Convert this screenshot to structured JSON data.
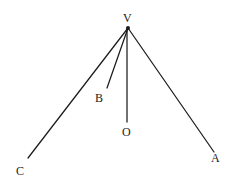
{
  "figure": {
    "name": "angle-rays-from-vertex-diagram",
    "background_color": "#ffffff",
    "stroke_color": "#1c1c1c",
    "label_color": "#1c1c1c",
    "width": 239,
    "height": 187,
    "vertex": {
      "label": "V",
      "x": 128,
      "y": 28
    },
    "points": [
      {
        "id": "V",
        "label": "V",
        "x": 128,
        "y": 28,
        "label_x": 125,
        "label_y": 18
      },
      {
        "id": "B",
        "label": "B",
        "x": 107,
        "y": 88,
        "label_x": 99,
        "label_y": 98
      },
      {
        "id": "O",
        "label": "O",
        "x": 127,
        "y": 122,
        "label_x": 127,
        "label_y": 132
      },
      {
        "id": "C",
        "label": "C",
        "x": 28,
        "y": 158,
        "label_x": 21,
        "label_y": 171
      },
      {
        "id": "A",
        "label": "A",
        "x": 214,
        "y": 152,
        "label_x": 216,
        "label_y": 158
      }
    ],
    "rays": [
      {
        "id": "VC",
        "from": "V",
        "to": "C",
        "x1": 128,
        "y1": 28,
        "x2": 28,
        "y2": 158
      },
      {
        "id": "VB",
        "from": "V",
        "to": "B",
        "x1": 128,
        "y1": 28,
        "x2": 107,
        "y2": 88
      },
      {
        "id": "VO",
        "from": "V",
        "to": "O",
        "x1": 127,
        "y1": 28,
        "x2": 127,
        "y2": 122
      },
      {
        "id": "VA",
        "from": "V",
        "to": "A",
        "x1": 128,
        "y1": 28,
        "x2": 214,
        "y2": 152
      }
    ]
  }
}
